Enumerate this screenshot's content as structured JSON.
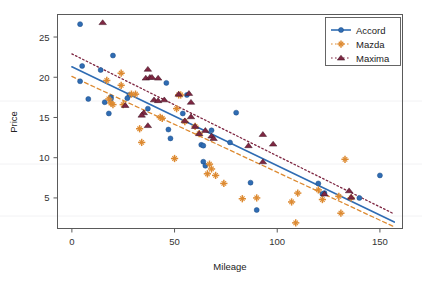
{
  "chart_data": {
    "type": "scatter",
    "title": "",
    "xlabel": "Mileage",
    "ylabel": "Price",
    "xlim": [
      -7,
      161
    ],
    "ylim": [
      1.2,
      27.8
    ],
    "xticks": [
      0,
      50,
      100,
      150
    ],
    "yticks": [
      5,
      10,
      15,
      20,
      25
    ],
    "grid": false,
    "legend_position": "top-right",
    "series": [
      {
        "name": "Accord",
        "color": "#2f6cb3",
        "marker": "circle",
        "linestyle": "solid",
        "trendline": {
          "x0": 0,
          "y0": 21.3,
          "x1": 157,
          "y1": 2.0
        },
        "points": [
          [
            4,
            26.6
          ],
          [
            5,
            21.4
          ],
          [
            4,
            19.5
          ],
          [
            8,
            17.3
          ],
          [
            14,
            20.9
          ],
          [
            16,
            16.9
          ],
          [
            20,
            22.7
          ],
          [
            19,
            17.5
          ],
          [
            19,
            17.3
          ],
          [
            18,
            15.5
          ],
          [
            28,
            17.8
          ],
          [
            27,
            17.4
          ],
          [
            37,
            16.1
          ],
          [
            46,
            19.3
          ],
          [
            47,
            13.5
          ],
          [
            48,
            12.4
          ],
          [
            54,
            15.5
          ],
          [
            56,
            17.8
          ],
          [
            63,
            11.6
          ],
          [
            64,
            11.5
          ],
          [
            64,
            9.5
          ],
          [
            65,
            9.0
          ],
          [
            68,
            13.4
          ],
          [
            77,
            11.9
          ],
          [
            80,
            15.6
          ],
          [
            87,
            6.9
          ],
          [
            90,
            3.5
          ],
          [
            120,
            6.8
          ],
          [
            122,
            5.5
          ],
          [
            123,
            5.6
          ],
          [
            140,
            5.0
          ],
          [
            150,
            7.8
          ]
        ]
      },
      {
        "name": "Mazda",
        "color": "#dd8a31",
        "marker": "plus",
        "linestyle": "dashed",
        "trendline": {
          "x0": 0,
          "y0": 20.1,
          "x1": 157,
          "y1": 1.4
        },
        "points": [
          [
            17,
            19.6
          ],
          [
            18,
            17.3
          ],
          [
            19,
            16.8
          ],
          [
            20,
            16.6
          ],
          [
            24,
            20.5
          ],
          [
            24,
            19.0
          ],
          [
            25,
            16.6
          ],
          [
            29,
            17.9
          ],
          [
            31,
            17.9
          ],
          [
            33,
            13.6
          ],
          [
            34,
            11.9
          ],
          [
            43,
            15.0
          ],
          [
            44,
            14.9
          ],
          [
            50,
            9.9
          ],
          [
            51,
            16.1
          ],
          [
            52,
            17.8
          ],
          [
            53,
            17.8
          ],
          [
            55,
            14.5
          ],
          [
            60,
            13.9
          ],
          [
            62,
            13.0
          ],
          [
            66,
            8.0
          ],
          [
            67,
            9.2
          ],
          [
            68,
            8.6
          ],
          [
            70,
            7.8
          ],
          [
            74,
            6.8
          ],
          [
            83,
            4.9
          ],
          [
            90,
            5.0
          ],
          [
            107,
            4.5
          ],
          [
            109,
            1.9
          ],
          [
            110,
            5.6
          ],
          [
            120,
            6.0
          ],
          [
            122,
            4.8
          ],
          [
            130,
            5.2
          ],
          [
            131,
            3.1
          ],
          [
            133,
            9.8
          ],
          [
            136,
            5.0
          ]
        ]
      },
      {
        "name": "Maxima",
        "color": "#7e2742",
        "marker": "triangle",
        "linestyle": "dotted",
        "trendline": {
          "x0": 0,
          "y0": 22.9,
          "x1": 157,
          "y1": 3.0
        },
        "points": [
          [
            15,
            26.8
          ],
          [
            26,
            16.5
          ],
          [
            35,
            15.6
          ],
          [
            34,
            15.3
          ],
          [
            36,
            19.9
          ],
          [
            37,
            21.0
          ],
          [
            38,
            20.0
          ],
          [
            39,
            20.0
          ],
          [
            42,
            19.9
          ],
          [
            40,
            17.2
          ],
          [
            42,
            17.1
          ],
          [
            45,
            17.2
          ],
          [
            52,
            17.9
          ],
          [
            57,
            18.0
          ],
          [
            58,
            16.9
          ],
          [
            37,
            14.0
          ],
          [
            55,
            14.6
          ],
          [
            60,
            13.9
          ],
          [
            62,
            13.0
          ],
          [
            68,
            12.7
          ],
          [
            69,
            12.4
          ],
          [
            86,
            11.5
          ],
          [
            93,
            12.9
          ],
          [
            98,
            11.7
          ],
          [
            93,
            9.5
          ],
          [
            123,
            5.5
          ],
          [
            135,
            5.9
          ],
          [
            136,
            5.1
          ],
          [
            65,
            13.4
          ],
          [
            58,
            15.1
          ]
        ]
      }
    ]
  },
  "axes": {
    "x_tick_labels": [
      "0",
      "50",
      "100",
      "150"
    ],
    "y_tick_labels": [
      "5",
      "10",
      "15",
      "20",
      "25"
    ],
    "x_axis_title": "Mileage",
    "y_axis_title": "Price"
  },
  "legend": {
    "entries": [
      {
        "label": "Accord",
        "color": "#2f6cb3",
        "marker": "circle",
        "line": "solid"
      },
      {
        "label": "Mazda",
        "color": "#dd8a31",
        "marker": "plus",
        "line": "dotted"
      },
      {
        "label": "Maxima",
        "color": "#7e2742",
        "marker": "triangle",
        "line": "dotted"
      }
    ]
  }
}
